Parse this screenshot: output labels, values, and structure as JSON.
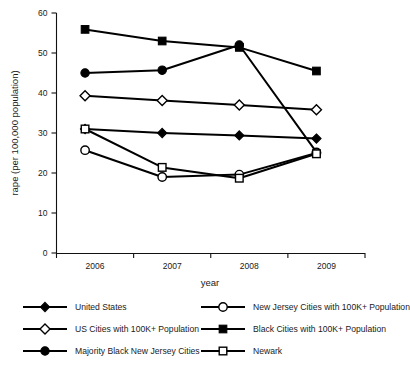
{
  "chart_data": {
    "type": "line",
    "title": "",
    "xlabel": "year",
    "ylabel": "rape (per 100,000 population)",
    "categories": [
      "2006",
      "2007",
      "2008",
      "2009"
    ],
    "ylim": [
      0,
      60
    ],
    "yticks": [
      0,
      10,
      20,
      30,
      40,
      50,
      60
    ],
    "ytick_labels": [
      "0",
      "10",
      "20",
      "30",
      "40",
      "50",
      "60"
    ],
    "grid": false,
    "legend_position": "below-plot-two-columns",
    "series": [
      {
        "name": "United States",
        "marker": "filled-diamond",
        "values": [
          31.0,
          30.0,
          29.4,
          28.6
        ]
      },
      {
        "name": "US Cities with 100K+ Population",
        "marker": "open-diamond",
        "values": [
          39.3,
          38.1,
          37.0,
          35.8
        ]
      },
      {
        "name": "Majority Black New Jersey Cities",
        "marker": "filled-circle",
        "values": [
          45.0,
          45.7,
          52.0,
          25.2
        ]
      },
      {
        "name": "New Jersey Cities with 100K+ Population",
        "marker": "open-circle",
        "values": [
          25.7,
          19.0,
          19.6,
          25.0
        ]
      },
      {
        "name": "Black Cities with 100K+ Population",
        "marker": "filled-square",
        "values": [
          55.9,
          53.0,
          51.4,
          45.5
        ]
      },
      {
        "name": "Newark",
        "marker": "open-square",
        "values": [
          31.0,
          21.4,
          18.7,
          24.8
        ]
      }
    ]
  },
  "legend": {
    "items": [
      {
        "label": "United States",
        "marker": "filled-diamond",
        "column": "left"
      },
      {
        "label": "US Cities with 100K+ Population",
        "marker": "open-diamond",
        "column": "left"
      },
      {
        "label": "Majority Black New Jersey Cities",
        "marker": "filled-circle",
        "column": "left"
      },
      {
        "label": "New Jersey Cities with 100K+ Population",
        "marker": "open-circle",
        "column": "right"
      },
      {
        "label": "Black Cities with 100K+ Population",
        "marker": "filled-square",
        "column": "right"
      },
      {
        "label": "Newark",
        "marker": "open-square",
        "column": "right"
      }
    ]
  },
  "colors": {
    "series": "#000000",
    "axis": "#111111",
    "background": "#ffffff",
    "open_marker_fill": "#ffffff"
  }
}
